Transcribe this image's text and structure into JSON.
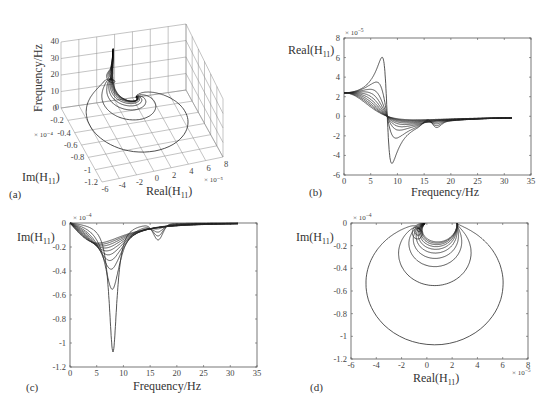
{
  "chart_data": [
    {
      "id": "a",
      "panel_label": "(a)",
      "type": "line3d",
      "title": "",
      "xlabel": "Real(H11)",
      "ylabel": "Im(H11)",
      "zlabel": "Frequency/Hz",
      "x_ticks": [
        "-6",
        "-4",
        "-2",
        "0",
        "2",
        "4",
        "6",
        "8"
      ],
      "x_exponent": "× 10⁻⁵",
      "y_ticks": [
        "0",
        "-0.2",
        "-0.4",
        "-0.6",
        "-0.8",
        "-1",
        "-1.2"
      ],
      "y_exponent": "× 10⁻⁴",
      "z_ticks": [
        "0",
        "10",
        "20",
        "30",
        "40"
      ],
      "xlim": [
        -6e-05,
        8e-05
      ],
      "ylim": [
        -0.00012,
        0
      ],
      "zlim": [
        0,
        40
      ],
      "grid": true
    },
    {
      "id": "b",
      "panel_label": "(b)",
      "type": "line",
      "title": "",
      "xlabel": "Frequency/Hz",
      "ylabel": "Real(H11)",
      "x_ticks": [
        "0",
        "5",
        "10",
        "15",
        "20",
        "25",
        "30",
        "35"
      ],
      "y_ticks": [
        "8",
        "6",
        "4",
        "2",
        "0",
        "-2",
        "-4",
        "-6"
      ],
      "y_exponent": "× 10⁻⁵",
      "xlim": [
        0,
        35
      ],
      "ylim": [
        -6e-05,
        8e-05
      ],
      "grid": false,
      "notes": "Family of real-part FRF curves; start at 2.4e-5, peak ~6e-5 near 7 Hz for lightest damping, crossing zero near 8 Hz, minimum ~-4.6e-5 near 9 Hz, small bump near 15-17 Hz, converging to ~-0.2e-5 at 31.5 Hz"
    },
    {
      "id": "c",
      "panel_label": "(c)",
      "type": "line",
      "title": "",
      "xlabel": "Frequency/Hz",
      "ylabel": "Im(H11)",
      "x_ticks": [
        "0",
        "5",
        "10",
        "15",
        "20",
        "25",
        "30",
        "35"
      ],
      "y_ticks": [
        "0",
        "-0.2",
        "-0.4",
        "-0.6",
        "-0.8",
        "-1",
        "-1.2"
      ],
      "y_exponent": "× 10⁻⁴",
      "xlim": [
        0,
        35
      ],
      "ylim": [
        -0.00012,
        0
      ],
      "grid": false,
      "notes": "Family of imaginary-part FRF curves; deepest minimum ~-1.07e-4 at ~8.2 Hz, next ~-0.55e-4, ~-0.37e-4, ~-0.3e-4 ... shallowest ~-0.17e-4; secondary dip ~-0.13e-4 near 16.5 Hz"
    },
    {
      "id": "d",
      "panel_label": "(d)",
      "type": "line",
      "title": "",
      "xlabel": "Real(H11)",
      "ylabel": "Im(H11)",
      "x_ticks": [
        "-6",
        "-4",
        "-2",
        "0",
        "2",
        "4",
        "6",
        "8"
      ],
      "x_exponent": "× 10⁻⁵",
      "y_ticks": [
        "0",
        "-0.2",
        "-0.4",
        "-0.6",
        "-0.8",
        "-1",
        "-1.2"
      ],
      "y_exponent": "× 10⁻⁴",
      "xlim": [
        -6e-05,
        8e-05
      ],
      "ylim": [
        -0.00012,
        0
      ],
      "grid": false,
      "notes": "Nyquist circles; largest spans Real -4.5e-5 to 6e-5, Im 0 to -1.07e-4"
    }
  ],
  "model": {
    "static_value": 2.4e-05,
    "natural_freq_hz": 8.1,
    "damping_ratios": [
      0.112,
      0.22,
      0.32,
      0.4,
      0.48,
      0.56,
      0.64,
      0.72,
      0.8,
      0.88
    ],
    "freq_max_hz": 31.5,
    "secondary_mode": {
      "freq_hz": 16.5,
      "amplitude": 1.3e-05,
      "width_hz": 1.2
    }
  },
  "labels": {
    "a": {
      "tag": "(a)",
      "xlabel": "Real(H",
      "ylabel": "Im(H",
      "zlabel": "Frequency/Hz",
      "sub": "11",
      "close": ")"
    },
    "b": {
      "tag": "(b)",
      "xlabel": "Frequency/Hz",
      "ylabel": "Real(H",
      "sub": "11",
      "close": ")",
      "exp": "× 10",
      "exp_pow": "−5"
    },
    "c": {
      "tag": "(c)",
      "xlabel": "Frequency/Hz",
      "ylabel": "Im(H",
      "sub": "11",
      "close": ")",
      "exp": "× 10",
      "exp_pow": "−4"
    },
    "d": {
      "tag": "(d)",
      "xlabel": "Real(H",
      "ylabel": "Im(H",
      "sub": "11",
      "close": ")",
      "exp_x": "× 10",
      "exp_x_pow": "−5",
      "exp_y": "× 10",
      "exp_y_pow": "−4"
    }
  }
}
